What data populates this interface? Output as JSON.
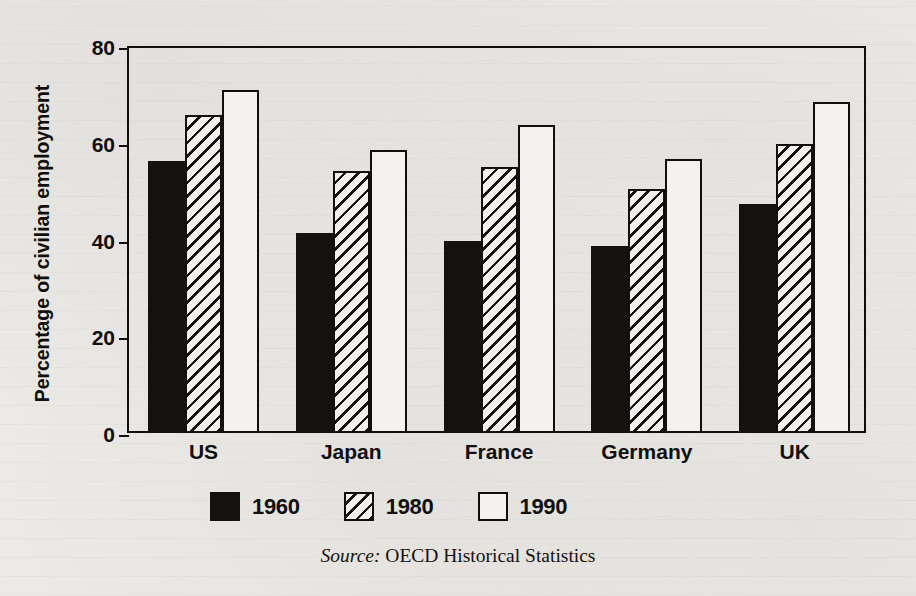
{
  "chart_data": {
    "type": "bar",
    "title": "",
    "subtitle": "",
    "xlabel": "",
    "ylabel": "Percentage of civilian employment",
    "ylim": [
      0,
      80
    ],
    "yticks": [
      0,
      20,
      40,
      60,
      80
    ],
    "ytick_labels": [
      "0",
      "20",
      "40",
      "60",
      "80"
    ],
    "grid": false,
    "legend_position": "bottom-center",
    "categories": [
      "US",
      "Japan",
      "France",
      "Germany",
      "UK"
    ],
    "series": [
      {
        "name": "1960",
        "fill": "fill-solid",
        "values": [
          56.2,
          41.3,
          39.6,
          38.7,
          47.4
        ]
      },
      {
        "name": "1980",
        "fill": "fill-hatch",
        "values": [
          65.7,
          54.1,
          55.0,
          50.5,
          59.7
        ]
      },
      {
        "name": "1990",
        "fill": "fill-open",
        "values": [
          70.9,
          58.5,
          63.6,
          56.7,
          68.5
        ]
      }
    ],
    "annotations": {
      "source_word": "Source:",
      "source_text": "OECD Historical Statistics"
    }
  },
  "colors": {
    "ink": "#100f0d",
    "paper": "#eceae6",
    "bar_fill_light": "#f4f2ee",
    "bar_fill_dark": "#141210"
  }
}
